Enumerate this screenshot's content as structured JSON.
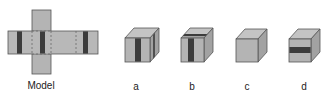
{
  "colors": {
    "face": "#b4b4b4",
    "face_top": "#c4c4c4",
    "face_side": "#a2a2a2",
    "stripe": "#3c3c3c",
    "edge": "#555555",
    "dash": "#6a6a6a"
  },
  "model": {
    "label": "Model",
    "description": "Cross-shaped cube net with dark vertical stripes on faces; dashed fold lines"
  },
  "options": [
    {
      "id": "a",
      "label": "a",
      "pattern": "vertical stripe on front face, stripe on right face"
    },
    {
      "id": "b",
      "label": "b",
      "pattern": "vertical stripe on front face, stripe on top face"
    },
    {
      "id": "c",
      "label": "c",
      "pattern": "plain cube"
    },
    {
      "id": "d",
      "label": "d",
      "pattern": "horizontal stripe on front face"
    }
  ]
}
